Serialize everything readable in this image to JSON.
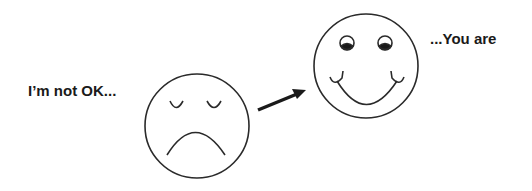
{
  "left_caption": "I’m not OK...",
  "right_caption": "...You are",
  "faces": {
    "sad": {
      "expression": "sad",
      "eyes": "closed"
    },
    "happy": {
      "expression": "happy",
      "eyes": "open"
    }
  },
  "arrow": {
    "direction": "from sad face toward happy face"
  },
  "colors": {
    "stroke": "#2a2a2a",
    "background": "#ffffff"
  }
}
